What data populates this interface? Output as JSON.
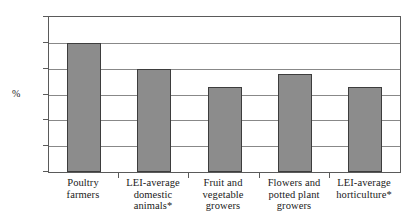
{
  "chart_data": {
    "type": "bar",
    "title": "",
    "subtitle": "",
    "xlabel": "",
    "ylabel": "%",
    "ylim": [
      0,
      60
    ],
    "ytick_interval": 10,
    "yticks": [
      "0",
      "10",
      "20",
      "30",
      "40",
      "50",
      "60"
    ],
    "grid": true,
    "legend": "none",
    "categories": [
      "Poultry farmers",
      "LEI-average domestic animals*",
      "Fruit and vegetable growers",
      "Flowers and potted plant growers",
      "LEI-average horticulture*"
    ],
    "category_lines": [
      [
        "Poultry",
        "farmers"
      ],
      [
        "LEI-average",
        "domestic",
        "animals*"
      ],
      [
        "Fruit and",
        "vegetable",
        "growers"
      ],
      [
        "Flowers and",
        "potted plant",
        "growers"
      ],
      [
        "LEI-average",
        "horticulture*"
      ]
    ],
    "values": [
      50,
      40,
      33,
      38,
      33
    ],
    "series": [
      {
        "name": "",
        "values": [
          50,
          40,
          33,
          38,
          33
        ]
      }
    ],
    "colors": {
      "bar_fill": "#8c8c8c",
      "bar_border": "#3d3d3d",
      "gridline": "#888888",
      "axis": "#5a5a5a",
      "text": "#1a1a1a",
      "background": "#ffffff"
    }
  }
}
